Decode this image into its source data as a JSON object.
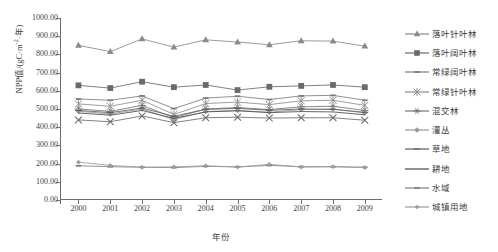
{
  "chart_data": {
    "type": "line",
    "title": "",
    "xlabel": "年份",
    "ylabel": "NPP值/(gC·m-2·年)",
    "ylabel_plain": "NPP值/(gC·m⁻²·年)",
    "grid": false,
    "legend_position": "right",
    "xlim": [
      2000,
      2009
    ],
    "ylim": [
      0,
      1000
    ],
    "ytick_step": 100,
    "x": [
      2000,
      2001,
      2002,
      2003,
      2004,
      2005,
      2006,
      2007,
      2008,
      2009
    ],
    "categories": [
      "2000",
      "2001",
      "2002",
      "2003",
      "2004",
      "2005",
      "2006",
      "2007",
      "2008",
      "2009"
    ],
    "ytick_labels": [
      "1000.00",
      "900.00",
      "800.00",
      "700.00",
      "600.00",
      "500.00",
      "400.00",
      "300.00",
      "200.00",
      "100.00",
      "0.00"
    ],
    "ytick_values": [
      1000,
      900,
      800,
      700,
      600,
      500,
      400,
      300,
      200,
      100,
      0
    ],
    "series": [
      {
        "name": "落叶针叶林",
        "marker": "triangle",
        "color": "#8a8a8a",
        "values": [
          850,
          815,
          885,
          840,
          880,
          868,
          853,
          875,
          873,
          845
        ]
      },
      {
        "name": "落叶阔叶林",
        "marker": "square",
        "color": "#6a6a6a",
        "values": [
          630,
          615,
          650,
          620,
          632,
          604,
          622,
          627,
          632,
          620
        ]
      },
      {
        "name": "常绿阔叶林",
        "marker": "dash",
        "color": "#7d7d7d",
        "values": [
          555,
          548,
          572,
          502,
          560,
          570,
          552,
          572,
          575,
          548
        ]
      },
      {
        "name": "常绿针叶林",
        "marker": "star4",
        "color": "#8c8c8c",
        "values": [
          528,
          515,
          548,
          470,
          530,
          538,
          524,
          545,
          548,
          520
        ]
      },
      {
        "name": "混交林",
        "marker": "star6",
        "color": "#757575",
        "values": [
          500,
          487,
          520,
          452,
          500,
          508,
          497,
          512,
          515,
          492
        ]
      },
      {
        "name": "灌丛",
        "marker": "diamond",
        "color": "#9a9a9a",
        "values": [
          487,
          473,
          500,
          442,
          486,
          492,
          482,
          497,
          500,
          478
        ]
      },
      {
        "name": "草地",
        "marker": "tick",
        "color": "#5e5e5e",
        "values": [
          492,
          480,
          505,
          460,
          498,
          503,
          493,
          500,
          498,
          482
        ]
      },
      {
        "name": "耕地",
        "marker": "none",
        "color": "#4a4a4a",
        "values": [
          478,
          466,
          492,
          448,
          484,
          490,
          480,
          486,
          484,
          468
        ]
      },
      {
        "name": "水域",
        "marker": "dash2",
        "color": "#808080",
        "values": [
          188,
          183,
          180,
          178,
          185,
          182,
          190,
          183,
          183,
          180
        ]
      },
      {
        "name": "城镇用地",
        "marker": "smalldiamond",
        "color": "#9c9c9c",
        "values": [
          208,
          190,
          180,
          182,
          188,
          181,
          196,
          181,
          183,
          178
        ]
      }
    ],
    "cluster_series_low": [
      {
        "name": "常绿针叶林-x",
        "marker": "xcross",
        "color": "#6b6b6b",
        "values": [
          440,
          430,
          462,
          425,
          452,
          455,
          450,
          452,
          452,
          438
        ]
      }
    ]
  }
}
